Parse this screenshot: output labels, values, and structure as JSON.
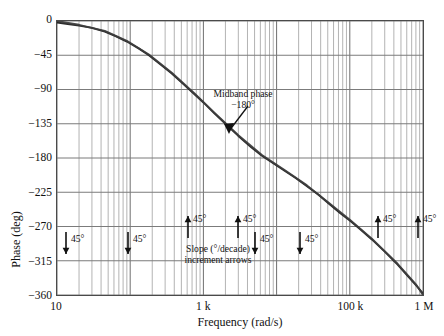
{
  "chart_data": {
    "type": "line",
    "title": "",
    "xlabel": "Frequency (rad/s)",
    "ylabel": "Phase (deg)",
    "xscale": "log",
    "xlim": [
      10,
      1000000
    ],
    "ylim": [
      -360,
      0
    ],
    "grid": true,
    "grid_minor": true,
    "legend": "none",
    "xticks": [
      {
        "value": 10,
        "label": "10"
      },
      {
        "value": 1000,
        "label": "1 k"
      },
      {
        "value": 100000,
        "label": "100 k"
      },
      {
        "value": 1000000,
        "label": "1 M"
      }
    ],
    "yticks": [
      {
        "value": 0,
        "label": "0"
      },
      {
        "value": -45,
        "label": "−45"
      },
      {
        "value": -90,
        "label": "−90"
      },
      {
        "value": -135,
        "label": "−135"
      },
      {
        "value": -180,
        "label": "−180"
      },
      {
        "value": -225,
        "label": "−225"
      },
      {
        "value": -270,
        "label": "−270"
      },
      {
        "value": -315,
        "label": "−315"
      },
      {
        "value": -360,
        "label": "−360"
      }
    ],
    "series": [
      {
        "name": "exact phase",
        "color": "#1a1a1a",
        "x": [
          10,
          14,
          20,
          30,
          45,
          63,
          90,
          130,
          180,
          260,
          370,
          520,
          750,
          1000,
          1400,
          2000,
          3000,
          4500,
          6300,
          9000,
          13000,
          18000,
          26000,
          37000,
          52000,
          75000,
          100000,
          140000,
          200000,
          300000,
          450000,
          630000,
          800000,
          1000000
        ],
        "y": [
          -2,
          -4,
          -6,
          -9,
          -14,
          -20,
          -27,
          -36,
          -45,
          -57,
          -69,
          -82,
          -96,
          -107,
          -121,
          -135,
          -151,
          -166,
          -177,
          -187,
          -197,
          -206,
          -217,
          -228,
          -240,
          -253,
          -262,
          -274,
          -287,
          -303,
          -320,
          -336,
          -347,
          -358
        ]
      },
      {
        "name": "asymptotic phase",
        "color": "#3d3d3d",
        "x": [
          10,
          20,
          45,
          90,
          180,
          370,
          750,
          1400,
          3000,
          6300,
          13000,
          26000,
          52000,
          100000,
          200000,
          450000,
          800000,
          1000000
        ],
        "y": [
          0,
          -5,
          -13,
          -26,
          -44,
          -68,
          -95,
          -120,
          -150,
          -176,
          -196,
          -216,
          -239,
          -261,
          -286,
          -319,
          -346,
          -360
        ]
      }
    ],
    "annotations": {
      "midband": {
        "line1": "Midband phase",
        "line2": "−180°",
        "leader": "arrow pointing down-left to curve"
      },
      "slope_caption": {
        "line1": "Slope (°/decade)",
        "line2": "increment arrows"
      },
      "arrows": [
        {
          "direction": "down",
          "label": "45°",
          "x_px": 66,
          "y_px": 232
        },
        {
          "direction": "down",
          "label": "45°",
          "x_px": 128,
          "y_px": 232
        },
        {
          "direction": "up",
          "label": "45°",
          "x_px": 188,
          "y_px": 216
        },
        {
          "direction": "up",
          "label": "45°",
          "x_px": 238,
          "y_px": 216
        },
        {
          "direction": "down",
          "label": "45°",
          "x_px": 255,
          "y_px": 232
        },
        {
          "direction": "down",
          "label": "45°",
          "x_px": 300,
          "y_px": 232
        },
        {
          "direction": "up",
          "label": "45°",
          "x_px": 378,
          "y_px": 216
        },
        {
          "direction": "up",
          "label": "45°",
          "x_px": 418,
          "y_px": 216
        }
      ]
    }
  }
}
